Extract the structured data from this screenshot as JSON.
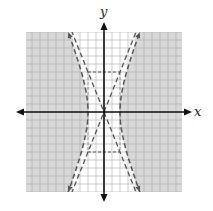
{
  "chart_data": {
    "type": "line",
    "title": "",
    "xlabel": "x",
    "ylabel": "y",
    "xlim": [
      -10,
      10
    ],
    "ylim": [
      -10,
      10
    ],
    "grid": true,
    "grid_step": 1,
    "shading": {
      "description": "Region outside the hyperbola branches is shaded gray; region between the branches is unshaded.",
      "inequality": "x^2/4 - y^2/25 >= 1"
    },
    "series": [
      {
        "name": "hyperbola",
        "equation": "x^2/4 - y^2/25 = 1",
        "style": "dashed",
        "vertices": [
          [
            -2,
            0
          ],
          [
            2,
            0
          ]
        ],
        "asymptote_slope": 2.5
      },
      {
        "name": "asymptote-positive",
        "equation": "y = 2.5x",
        "style": "dashed"
      },
      {
        "name": "asymptote-negative",
        "equation": "y = -2.5x",
        "style": "dashed"
      },
      {
        "name": "central-rectangle",
        "corners": [
          [
            -2,
            5
          ],
          [
            2,
            5
          ],
          [
            2,
            -5
          ],
          [
            -2,
            -5
          ]
        ],
        "style": "dashed"
      }
    ]
  },
  "labels": {
    "x_axis": "x",
    "y_axis": "y"
  },
  "colors": {
    "shade": "#d9d9d9",
    "grid_shaded": "#a9a9a9",
    "grid_unshaded": "#c4c4c4",
    "axis": "#111111",
    "curve": "#555555"
  }
}
